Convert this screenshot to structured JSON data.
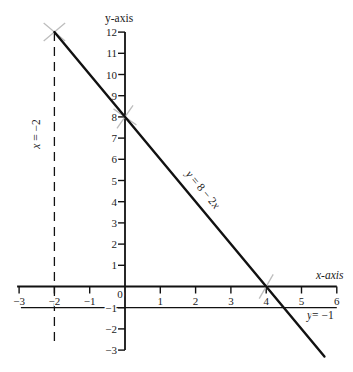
{
  "chart_data": {
    "type": "line",
    "title": "",
    "xlabel": "x-axis",
    "ylabel": "y-axis",
    "xlim": [
      -3,
      6
    ],
    "ylim": [
      -3,
      12
    ],
    "grid": false,
    "legend": "none",
    "x_ticks": [
      -3,
      -2,
      -1,
      0,
      1,
      2,
      3,
      4,
      5,
      6
    ],
    "x_tick_labels": [
      "−3",
      "−2",
      "−1",
      "0",
      "1",
      "2",
      "3",
      "4",
      "5",
      "6"
    ],
    "y_ticks": [
      -3,
      -2,
      -1,
      1,
      2,
      3,
      4,
      5,
      6,
      7,
      8,
      9,
      10,
      11,
      12
    ],
    "y_tick_labels": [
      "−3",
      "−2",
      "−1",
      "1",
      "2",
      "3",
      "4",
      "5",
      "6",
      "7",
      "8",
      "9",
      "10",
      "11",
      "12"
    ],
    "series": [
      {
        "name": "y = 8 − 2x",
        "style": "solid",
        "color": "#111111",
        "points": [
          [
            -2,
            12
          ],
          [
            0,
            8
          ],
          [
            4,
            0
          ],
          [
            4.5,
            -1
          ],
          [
            5.65,
            -3.3
          ]
        ]
      },
      {
        "name": "x = −2",
        "style": "dashed",
        "color": "#111111",
        "points": [
          [
            -2,
            12
          ],
          [
            -2,
            -2.7
          ]
        ]
      },
      {
        "name": "y = −1",
        "style": "solid",
        "color": "#111111",
        "points": [
          [
            -2.95,
            -1
          ],
          [
            6,
            -1
          ]
        ]
      }
    ],
    "marked_points": [
      {
        "x": -2,
        "y": 12
      },
      {
        "x": 0,
        "y": 8
      },
      {
        "x": 4,
        "y": 0
      }
    ],
    "mark_color": "#bdbdbd",
    "annotations": [
      {
        "id": "line-label",
        "parts": [
          {
            "text": "y",
            "italic": true
          },
          {
            "text": " = 8 − 2",
            "italic": false
          },
          {
            "text": "x",
            "italic": true
          }
        ]
      },
      {
        "id": "vertical-label",
        "parts": [
          {
            "text": "x",
            "italic": true
          },
          {
            "text": " = −2",
            "italic": false
          }
        ]
      },
      {
        "id": "horizontal-label",
        "parts": [
          {
            "text": "y",
            "italic": true
          },
          {
            "text": "= −1",
            "italic": false
          }
        ]
      }
    ]
  }
}
